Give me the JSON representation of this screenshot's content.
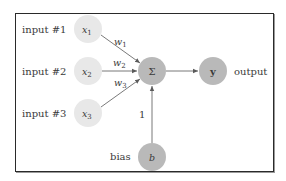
{
  "diagram": {
    "type": "perceptron",
    "inputs": [
      {
        "label": "input #1",
        "symbol": "x",
        "sub": "1",
        "weight": "w",
        "weight_sub": "1"
      },
      {
        "label": "input #2",
        "symbol": "x",
        "sub": "2",
        "weight": "w",
        "weight_sub": "2"
      },
      {
        "label": "input #3",
        "symbol": "x",
        "sub": "3",
        "weight": "w",
        "weight_sub": "3"
      }
    ],
    "sum_node": {
      "symbol": "Σ"
    },
    "output_node": {
      "symbol": "y",
      "label": "output"
    },
    "bias_node": {
      "symbol": "b",
      "label": "bias",
      "weight": "1"
    },
    "colors": {
      "input_fill": "#e8e8e8",
      "core_fill": "#b9b9b9",
      "edge": "#6a6a6a",
      "border": "#2a2a2a"
    }
  }
}
